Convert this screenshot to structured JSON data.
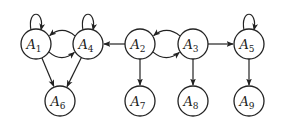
{
  "diagram": {
    "type": "directed-graph",
    "node_radius": 15,
    "nodes": [
      {
        "id": "A1",
        "base": "A",
        "sub": "1",
        "x": 36,
        "y": 44
      },
      {
        "id": "A4",
        "base": "A",
        "sub": "4",
        "x": 88,
        "y": 44
      },
      {
        "id": "A2",
        "base": "A",
        "sub": "2",
        "x": 140,
        "y": 44
      },
      {
        "id": "A3",
        "base": "A",
        "sub": "3",
        "x": 193,
        "y": 44
      },
      {
        "id": "A5",
        "base": "A",
        "sub": "5",
        "x": 249,
        "y": 44
      },
      {
        "id": "A6",
        "base": "A",
        "sub": "6",
        "x": 60,
        "y": 101
      },
      {
        "id": "A7",
        "base": "A",
        "sub": "7",
        "x": 140,
        "y": 101
      },
      {
        "id": "A8",
        "base": "A",
        "sub": "8",
        "x": 193,
        "y": 101
      },
      {
        "id": "A9",
        "base": "A",
        "sub": "9",
        "x": 249,
        "y": 101
      }
    ],
    "edges": [
      {
        "from": "A1",
        "to": "A1",
        "kind": "self-loop"
      },
      {
        "from": "A4",
        "to": "A4",
        "kind": "self-loop"
      },
      {
        "from": "A5",
        "to": "A5",
        "kind": "self-loop"
      },
      {
        "from": "A1",
        "to": "A4",
        "kind": "curved-below"
      },
      {
        "from": "A4",
        "to": "A1",
        "kind": "curved-above"
      },
      {
        "from": "A2",
        "to": "A4",
        "kind": "straight"
      },
      {
        "from": "A2",
        "to": "A3",
        "kind": "curved-below"
      },
      {
        "from": "A3",
        "to": "A2",
        "kind": "curved-above"
      },
      {
        "from": "A3",
        "to": "A5",
        "kind": "straight"
      },
      {
        "from": "A1",
        "to": "A6",
        "kind": "straight"
      },
      {
        "from": "A4",
        "to": "A6",
        "kind": "straight"
      },
      {
        "from": "A2",
        "to": "A7",
        "kind": "straight"
      },
      {
        "from": "A3",
        "to": "A8",
        "kind": "straight"
      },
      {
        "from": "A5",
        "to": "A9",
        "kind": "straight"
      }
    ]
  }
}
